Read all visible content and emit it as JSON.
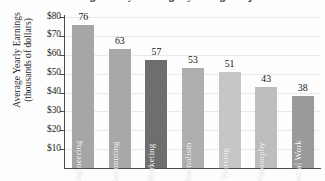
{
  "chart_data": {
    "type": "bar",
    "title": "Average Yearly Earnings by College Major",
    "xlabel": "",
    "ylabel": "Average Yearly Earnings (thousands of dollars)",
    "ylabel_line1": "Average Yearly Earnings",
    "ylabel_line2": "(thousands of dollars)",
    "categories": [
      "Engineering",
      "Accounting",
      "Marketing",
      "Journalism",
      "Nursing",
      "Philosophy",
      "Social Work"
    ],
    "values": [
      76,
      63,
      57,
      53,
      51,
      43,
      38
    ],
    "value_labels": [
      "76",
      "63",
      "57",
      "53",
      "51",
      "43",
      "38"
    ],
    "bar_colors": [
      "#a6a6a6",
      "#a8a8a8",
      "#6e6e6e",
      "#aeaeae",
      "#c6c6c6",
      "#bdbdbd",
      "#9a9a9a"
    ],
    "ylim": [
      0,
      80
    ],
    "ytick_values": [
      80,
      70,
      60,
      50,
      40,
      30,
      20,
      10
    ],
    "ytick_labels": [
      "$80",
      "$70",
      "$60",
      "$50",
      "$40",
      "$30",
      "$20",
      "$10"
    ],
    "grid": true,
    "grid_axis": "y",
    "legend": false,
    "units": "thousands of dollars",
    "currency_prefix": "$"
  }
}
